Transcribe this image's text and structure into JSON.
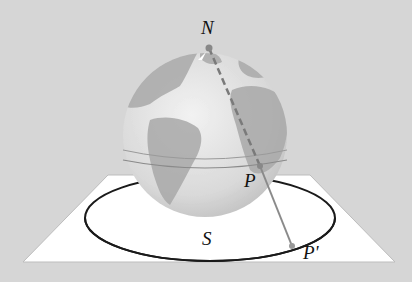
{
  "diagram": {
    "labels": {
      "north_pole": "N",
      "point_on_sphere": "P",
      "projected_point": "P'",
      "circle": "S"
    },
    "colors": {
      "background": "#d6d6d6",
      "plane": "#ffffff",
      "globe_ocean": "#e4e4e4",
      "globe_land": "#a8a8a8",
      "projection_line": "#8a8a8a",
      "circle": "#1a1a1a"
    }
  }
}
